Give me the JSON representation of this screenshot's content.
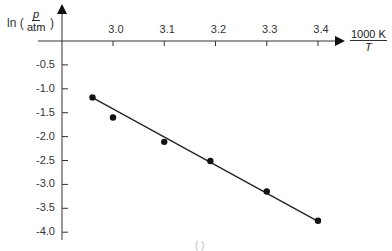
{
  "chart_data": {
    "type": "scatter",
    "title": "",
    "xlabel": {
      "numerator": "1000 K",
      "denominator": "T"
    },
    "ylabel": {
      "prefix": "ln (",
      "numerator": "p",
      "denominator": "atm",
      "suffix": ")"
    },
    "x_ticks": [
      "3.0",
      "3.1",
      "3.2",
      "3.3",
      "3.4"
    ],
    "y_ticks": [
      "-0.5",
      "-1.0",
      "-1.5",
      "-2.0",
      "-2.5",
      "-3.0",
      "-3.5",
      "-4.0"
    ],
    "xlim": [
      2.9,
      3.45
    ],
    "ylim": [
      -4.2,
      0
    ],
    "grid": false,
    "series": [
      {
        "name": "data points",
        "x": [
          2.96,
          3.0,
          3.1,
          3.19,
          3.3,
          3.4
        ],
        "y": [
          -1.18,
          -1.6,
          -2.11,
          -2.51,
          -3.15,
          -3.76
        ]
      }
    ],
    "fit_line": {
      "x": [
        2.96,
        3.4
      ],
      "y": [
        -1.18,
        -3.78
      ]
    },
    "annotations": [
      "( )"
    ]
  },
  "colors": {
    "axis": "#333333",
    "points": "#111111",
    "line": "#222222"
  }
}
